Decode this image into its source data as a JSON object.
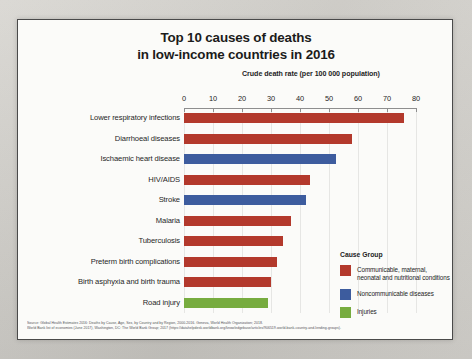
{
  "figure": {
    "title_line1": "Top 10 causes of deaths",
    "title_line2": "in low-income countries in 2016",
    "axis_title": "Crude death rate (per 100 000 population)"
  },
  "legend": {
    "title": "Cause Group",
    "items": [
      {
        "label": "Communicable, maternal, neonatal and nutritional conditions",
        "color": "#b3392c"
      },
      {
        "label": "Noncommunicable diseases",
        "color": "#3d5c9e"
      },
      {
        "label": "Injuries",
        "color": "#77ac3f"
      }
    ]
  },
  "source": {
    "line1": "Source: Global Health Estimates 2016: Deaths by Cause, Age, Sex, by Country and by Region, 2000-2016. Geneva, World Health Organization; 2018.",
    "line2": "World Bank list of economies (June 2017), Washington, DC: The World Bank Group; 2017 (https://datahelpdesk.worldbank.org/knowledgebase/articles/906519-world-bank-country-and-lending-groups)."
  },
  "chart_data": {
    "type": "bar",
    "orientation": "horizontal",
    "title": "Top 10 causes of deaths in low-income countries in 2016",
    "xlabel": "Crude death rate (per 100 000 population)",
    "ylabel": "",
    "xlim": [
      0,
      80
    ],
    "xticks": [
      0,
      10,
      20,
      30,
      40,
      50,
      60,
      70,
      80
    ],
    "grid": true,
    "legend_position": "right-bottom",
    "categories": [
      "Lower respiratory infections",
      "Diarrhoeal diseases",
      "Ischaemic heart disease",
      "HIV/AIDS",
      "Stroke",
      "Malaria",
      "Tuberculosis",
      "Preterm birth complications",
      "Birth asphyxia and birth trauma",
      "Road injury"
    ],
    "values": [
      76,
      58,
      52.5,
      43.5,
      42,
      37,
      34,
      32,
      30,
      29
    ],
    "groups": [
      "Communicable, maternal, neonatal and nutritional conditions",
      "Communicable, maternal, neonatal and nutritional conditions",
      "Noncommunicable diseases",
      "Communicable, maternal, neonatal and nutritional conditions",
      "Noncommunicable diseases",
      "Communicable, maternal, neonatal and nutritional conditions",
      "Communicable, maternal, neonatal and nutritional conditions",
      "Communicable, maternal, neonatal and nutritional conditions",
      "Communicable, maternal, neonatal and nutritional conditions",
      "Injuries"
    ],
    "colors": [
      "#b3392c",
      "#b3392c",
      "#3d5c9e",
      "#b3392c",
      "#3d5c9e",
      "#b3392c",
      "#b3392c",
      "#b3392c",
      "#b3392c",
      "#77ac3f"
    ]
  }
}
